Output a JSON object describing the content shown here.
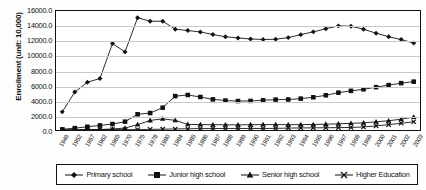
{
  "chart_data": {
    "type": "line",
    "title": "",
    "xlabel": "",
    "ylabel": "Enrollment (unit: 10,000)",
    "ylim": [
      0,
      16000
    ],
    "ytick_labels": [
      "16000.0",
      "14000.0",
      "12000.0",
      "10000.0",
      "8000.0",
      "6000.0",
      "4000.0",
      "2000.0",
      "0.0"
    ],
    "ytick_values": [
      16000,
      14000,
      12000,
      10000,
      8000,
      6000,
      4000,
      2000,
      0
    ],
    "grid": true,
    "legend_position": "bottom",
    "categories": [
      "1949",
      "1952",
      "1957",
      "1962",
      "1965",
      "1970",
      "1975",
      "1978",
      "1980",
      "1984",
      "1985",
      "1986",
      "1987",
      "1988",
      "1989",
      "1990",
      "1991",
      "1992",
      "1993",
      "1994",
      "1995",
      "1996",
      "1997",
      "1998",
      "1999",
      "2000",
      "2001",
      "2002",
      "2003"
    ],
    "series": [
      {
        "name": "Primary school",
        "marker": "diamond",
        "values": [
          2439,
          5100,
          6428,
          6924,
          11627,
          10500,
          15094,
          14624,
          14627,
          13557,
          13370,
          13183,
          12835,
          12536,
          12373,
          12241,
          12164,
          12201,
          12421,
          12822,
          13195,
          13615,
          13995,
          13954,
          13548,
          13013,
          12543,
          12157,
          11690
        ]
      },
      {
        "name": "Junior high school",
        "marker": "square",
        "values": [
          83,
          249,
          434,
          618,
          803,
          1122,
          2114,
          2280,
          3000,
          4556,
          4706,
          4440,
          4117,
          3963,
          3892,
          3910,
          3994,
          4083,
          4100,
          4217,
          4400,
          4667,
          5018,
          5266,
          5470,
          5760,
          6030,
          6300,
          6500
        ]
      },
      {
        "name": "Senior high school",
        "marker": "triangle",
        "values": [
          20,
          32,
          63,
          75,
          130,
          265,
          720,
          1288,
          1500,
          1300,
          752,
          723,
          709,
          702,
          694,
          713,
          722,
          730,
          718,
          724,
          740,
          780,
          827,
          896,
          963,
          1100,
          1250,
          1450,
          1750
        ]
      },
      {
        "name": "Higher Education",
        "marker": "cross",
        "values": [
          11,
          19,
          44,
          53,
          67,
          48,
          50,
          86,
          114,
          140,
          170,
          188,
          196,
          207,
          208,
          206,
          204,
          218,
          253,
          280,
          290,
          302,
          317,
          341,
          413,
          556,
          719,
          903,
          1108
        ]
      }
    ]
  },
  "legend": {
    "items": [
      {
        "label": "Primary school",
        "marker": "diamond"
      },
      {
        "label": "Junior high school",
        "marker": "square"
      },
      {
        "label": "Senior high school",
        "marker": "triangle"
      },
      {
        "label": "Higher Education",
        "marker": "cross"
      }
    ]
  }
}
